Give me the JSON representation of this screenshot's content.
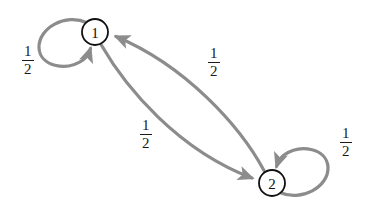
{
  "diagram": {
    "type": "state-transition-diagram",
    "background_color": "#ffffff",
    "edge_color": "#8c8c8c",
    "node_stroke_color": "#111111",
    "node_fill_color": "#ffffff",
    "text_color": "#1a1a1a",
    "nodes": [
      {
        "id": "1",
        "label": "1",
        "cx": 95,
        "cy": 32,
        "r": 13
      },
      {
        "id": "2",
        "label": "2",
        "cx": 272,
        "cy": 183,
        "r": 13
      }
    ],
    "edges": [
      {
        "id": "self-loop-1",
        "from": "1",
        "to": "1",
        "label_numerator": "1",
        "label_denominator": "2",
        "label_value": "1/2",
        "label_x": 22,
        "label_y": 44
      },
      {
        "id": "edge-2-to-1",
        "from": "2",
        "to": "1",
        "label_numerator": "1",
        "label_denominator": "2",
        "label_value": "1/2",
        "label_x": 208,
        "label_y": 46
      },
      {
        "id": "edge-1-to-2",
        "from": "1",
        "to": "2",
        "label_numerator": "1",
        "label_denominator": "2",
        "label_value": "1/2",
        "label_x": 140,
        "label_y": 118
      },
      {
        "id": "self-loop-2",
        "from": "2",
        "to": "2",
        "label_numerator": "1",
        "label_denominator": "2",
        "label_value": "1/2",
        "label_x": 340,
        "label_y": 126
      }
    ]
  }
}
